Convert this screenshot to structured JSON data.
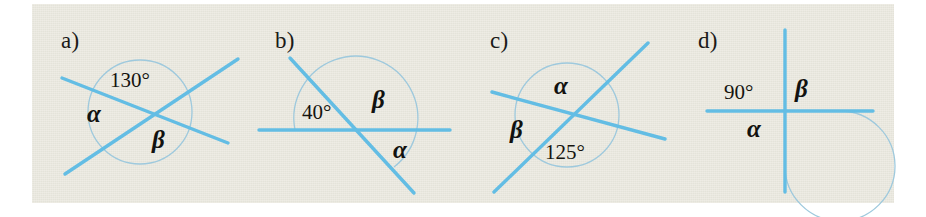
{
  "figure": {
    "background_color": "#ebe9df",
    "line_color": "#63bde4",
    "arc_color": "#9ec9dd",
    "text_color": "#15140f",
    "panel_count": 4
  },
  "panels": [
    {
      "id": "a",
      "label": "a)",
      "type": "two-intersecting-lines",
      "arc_shape": "full-circle",
      "labels": {
        "known_angle": "130°",
        "alpha": "α",
        "beta": "β"
      },
      "known_angle_value": 130,
      "known_angle_position": "top",
      "alpha_position": "left",
      "beta_position": "bottom"
    },
    {
      "id": "b",
      "label": "b)",
      "type": "line-and-transversal",
      "arc_shape": "large-arc",
      "labels": {
        "known_angle": "40°",
        "alpha": "α",
        "beta": "β"
      },
      "known_angle_value": 40,
      "known_angle_position": "upper-left",
      "beta_position": "upper-right",
      "alpha_position": "lower-right"
    },
    {
      "id": "c",
      "label": "c)",
      "type": "two-intersecting-lines",
      "arc_shape": "full-circle",
      "labels": {
        "known_angle": "125°",
        "alpha": "α",
        "beta": "β"
      },
      "known_angle_value": 125,
      "known_angle_position": "bottom",
      "alpha_position": "top",
      "beta_position": "left"
    },
    {
      "id": "d",
      "label": "d)",
      "type": "perpendicular-lines",
      "arc_shape": "large-arc",
      "labels": {
        "known_angle": "90°",
        "alpha": "α",
        "beta": "β"
      },
      "known_angle_value": 90,
      "known_angle_position": "upper-left",
      "beta_position": "upper-right",
      "alpha_position": "lower-left"
    }
  ]
}
